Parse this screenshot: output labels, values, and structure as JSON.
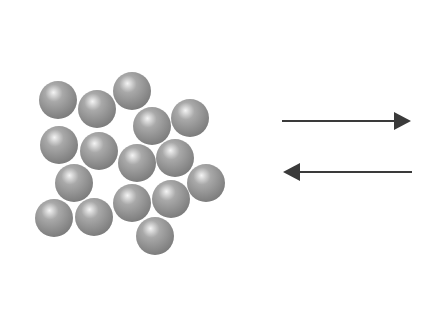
{
  "diagram": {
    "particles": {
      "count": 16,
      "color": "#a9a9a9",
      "highlight_color": "#f4f4f4",
      "shadow_color": "#7d7d7d"
    },
    "arrows": [
      {
        "id": "forward",
        "direction": "right",
        "color": "#3a3a3a"
      },
      {
        "id": "reverse",
        "direction": "left",
        "color": "#3a3a3a"
      }
    ]
  }
}
